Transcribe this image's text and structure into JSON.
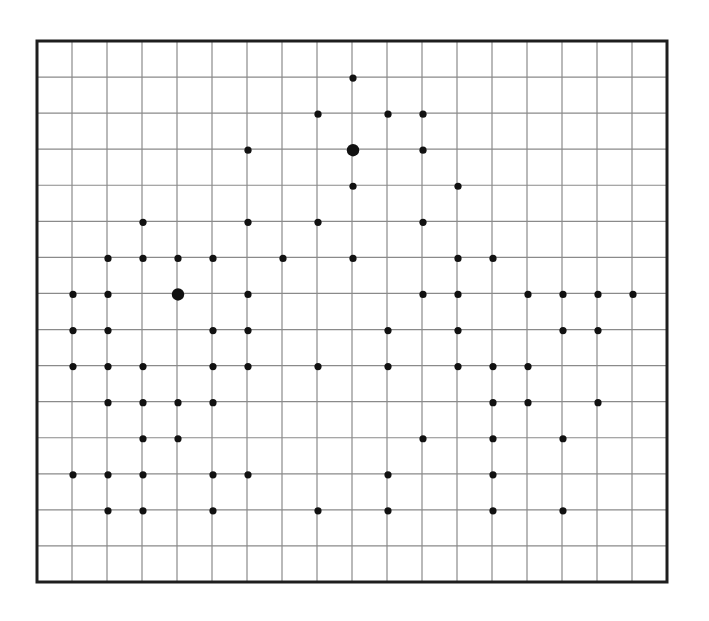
{
  "grid": {
    "columns": 18,
    "rows": 15,
    "width_px": 630,
    "height_px": 541,
    "line_color": "#8a8a8a",
    "border_color": "#1e1e1e",
    "dot_color": "#111111",
    "dot_radius": 3.6,
    "big_dot_radius": 6.2
  },
  "dots": [
    {
      "c": 9,
      "r": 1
    },
    {
      "c": 8,
      "r": 2
    },
    {
      "c": 10,
      "r": 2
    },
    {
      "c": 11,
      "r": 2
    },
    {
      "c": 6,
      "r": 3
    },
    {
      "c": 9,
      "r": 3,
      "big": true
    },
    {
      "c": 11,
      "r": 3
    },
    {
      "c": 9,
      "r": 4
    },
    {
      "c": 12,
      "r": 4
    },
    {
      "c": 3,
      "r": 5
    },
    {
      "c": 6,
      "r": 5
    },
    {
      "c": 8,
      "r": 5
    },
    {
      "c": 11,
      "r": 5
    },
    {
      "c": 2,
      "r": 6
    },
    {
      "c": 3,
      "r": 6
    },
    {
      "c": 4,
      "r": 6
    },
    {
      "c": 5,
      "r": 6
    },
    {
      "c": 7,
      "r": 6
    },
    {
      "c": 9,
      "r": 6
    },
    {
      "c": 12,
      "r": 6
    },
    {
      "c": 13,
      "r": 6
    },
    {
      "c": 1,
      "r": 7
    },
    {
      "c": 2,
      "r": 7
    },
    {
      "c": 4,
      "r": 7,
      "big": true
    },
    {
      "c": 6,
      "r": 7
    },
    {
      "c": 11,
      "r": 7
    },
    {
      "c": 12,
      "r": 7
    },
    {
      "c": 14,
      "r": 7
    },
    {
      "c": 15,
      "r": 7
    },
    {
      "c": 16,
      "r": 7
    },
    {
      "c": 17,
      "r": 7
    },
    {
      "c": 1,
      "r": 8
    },
    {
      "c": 2,
      "r": 8
    },
    {
      "c": 5,
      "r": 8
    },
    {
      "c": 6,
      "r": 8
    },
    {
      "c": 10,
      "r": 8
    },
    {
      "c": 12,
      "r": 8
    },
    {
      "c": 15,
      "r": 8
    },
    {
      "c": 16,
      "r": 8
    },
    {
      "c": 1,
      "r": 9
    },
    {
      "c": 2,
      "r": 9
    },
    {
      "c": 3,
      "r": 9
    },
    {
      "c": 5,
      "r": 9
    },
    {
      "c": 6,
      "r": 9
    },
    {
      "c": 8,
      "r": 9
    },
    {
      "c": 10,
      "r": 9
    },
    {
      "c": 12,
      "r": 9
    },
    {
      "c": 13,
      "r": 9
    },
    {
      "c": 14,
      "r": 9
    },
    {
      "c": 2,
      "r": 10
    },
    {
      "c": 3,
      "r": 10
    },
    {
      "c": 4,
      "r": 10
    },
    {
      "c": 5,
      "r": 10
    },
    {
      "c": 13,
      "r": 10
    },
    {
      "c": 14,
      "r": 10
    },
    {
      "c": 16,
      "r": 10
    },
    {
      "c": 3,
      "r": 11
    },
    {
      "c": 4,
      "r": 11
    },
    {
      "c": 11,
      "r": 11
    },
    {
      "c": 13,
      "r": 11
    },
    {
      "c": 15,
      "r": 11
    },
    {
      "c": 1,
      "r": 12
    },
    {
      "c": 2,
      "r": 12
    },
    {
      "c": 3,
      "r": 12
    },
    {
      "c": 5,
      "r": 12
    },
    {
      "c": 6,
      "r": 12
    },
    {
      "c": 10,
      "r": 12
    },
    {
      "c": 13,
      "r": 12
    },
    {
      "c": 2,
      "r": 13
    },
    {
      "c": 3,
      "r": 13
    },
    {
      "c": 5,
      "r": 13
    },
    {
      "c": 8,
      "r": 13
    },
    {
      "c": 10,
      "r": 13
    },
    {
      "c": 13,
      "r": 13
    },
    {
      "c": 15,
      "r": 13
    }
  ]
}
